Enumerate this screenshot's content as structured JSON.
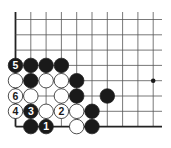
{
  "diagram": {
    "type": "go-board-corner",
    "grid": {
      "cols": 10,
      "rows": 8,
      "x0": 15.5,
      "y0": 19.5,
      "spacing": 15.3,
      "line_extend_right": 162,
      "line_extend_top": 12,
      "left_edge": true,
      "bottom_edge": true
    },
    "hoshi": [
      {
        "col": 9,
        "row": 4
      }
    ],
    "stones": [
      {
        "col": 0,
        "row": 3,
        "color": "black",
        "label": "5"
      },
      {
        "col": 1,
        "row": 3,
        "color": "black",
        "label": ""
      },
      {
        "col": 2,
        "row": 3,
        "color": "black",
        "label": ""
      },
      {
        "col": 3,
        "row": 3,
        "color": "black",
        "label": ""
      },
      {
        "col": 0,
        "row": 4,
        "color": "white",
        "label": ""
      },
      {
        "col": 1,
        "row": 4,
        "color": "black",
        "label": ""
      },
      {
        "col": 2,
        "row": 4,
        "color": "white",
        "label": ""
      },
      {
        "col": 3,
        "row": 4,
        "color": "white",
        "label": ""
      },
      {
        "col": 4,
        "row": 4,
        "color": "black",
        "label": ""
      },
      {
        "col": 0,
        "row": 5,
        "color": "white",
        "label": "6"
      },
      {
        "col": 1,
        "row": 5,
        "color": "white",
        "label": ""
      },
      {
        "col": 3,
        "row": 5,
        "color": "white",
        "label": ""
      },
      {
        "col": 4,
        "row": 5,
        "color": "black",
        "label": ""
      },
      {
        "col": 6,
        "row": 5,
        "color": "black",
        "label": ""
      },
      {
        "col": 0,
        "row": 6,
        "color": "white",
        "label": "4"
      },
      {
        "col": 1,
        "row": 6,
        "color": "black",
        "label": "3"
      },
      {
        "col": 2,
        "row": 6,
        "color": "white",
        "label": ""
      },
      {
        "col": 3,
        "row": 6,
        "color": "white",
        "label": "2"
      },
      {
        "col": 4,
        "row": 6,
        "color": "white",
        "label": ""
      },
      {
        "col": 5,
        "row": 6,
        "color": "black",
        "label": ""
      },
      {
        "col": 1,
        "row": 7,
        "color": "black",
        "label": ""
      },
      {
        "col": 2,
        "row": 7,
        "color": "black",
        "label": "1"
      },
      {
        "col": 4,
        "row": 7,
        "color": "white",
        "label": ""
      },
      {
        "col": 5,
        "row": 7,
        "color": "black",
        "label": ""
      }
    ],
    "colors": {
      "line": "#555555",
      "edge": "#222222",
      "black": "#1a1a1a",
      "white": "#ffffff"
    }
  }
}
